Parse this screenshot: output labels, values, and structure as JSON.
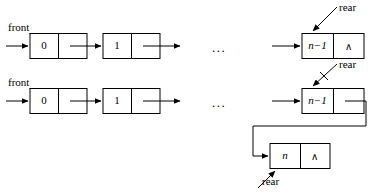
{
  "figure": {
    "background_color": "#ffffff",
    "stroke_color": "#000000"
  },
  "labels": {
    "front": "front",
    "rear": "rear",
    "ellipsis": "...",
    "null_pointer": "∧"
  },
  "rows": [
    {
      "id": "before-insert",
      "front_label": "front",
      "rear_label": "rear",
      "ellipsis": "...",
      "nodes": [
        {
          "value": "0",
          "next": "pointer",
          "null_mark": ""
        },
        {
          "value": "1",
          "next": "pointer",
          "null_mark": ""
        },
        {
          "value_prefix": "n",
          "value_suffix": "−1",
          "value": "n−1",
          "next": "null",
          "null_mark": "∧"
        }
      ]
    },
    {
      "id": "after-insert",
      "front_label": "front",
      "rear_label": "rear",
      "ellipsis": "...",
      "nodes": [
        {
          "value": "0",
          "next": "pointer",
          "null_mark": ""
        },
        {
          "value": "1",
          "next": "pointer",
          "null_mark": ""
        },
        {
          "value_prefix": "n",
          "value_suffix": "−1",
          "value": "n−1",
          "next": "pointer-to-new",
          "null_mark": ""
        },
        {
          "value_prefix": "n",
          "value_suffix": "",
          "value": "n",
          "next": "null",
          "null_mark": "∧"
        }
      ]
    }
  ]
}
